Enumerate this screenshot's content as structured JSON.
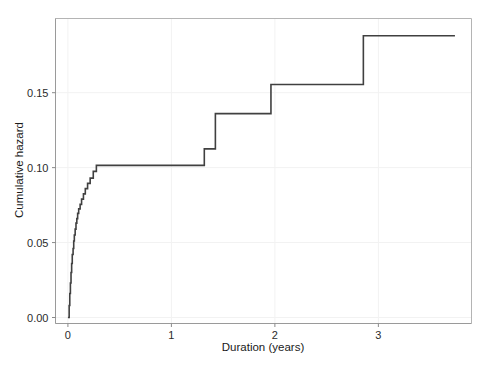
{
  "chart_data": {
    "type": "line",
    "subtype": "step-post",
    "title": "",
    "xlabel": "Duration (years)",
    "ylabel": "Cumulative hazard",
    "xlim": [
      -0.12,
      3.9
    ],
    "ylim": [
      -0.004,
      0.1995
    ],
    "grid": true,
    "grid_color": "#f2f2f2",
    "line_color": "#404040",
    "line_width": 1.6,
    "legend": null,
    "xticks": [
      0,
      1,
      2,
      3
    ],
    "xtick_labels": [
      "0",
      "1",
      "2",
      "3"
    ],
    "yticks": [
      0.0,
      0.05,
      0.1,
      0.15
    ],
    "ytick_labels": [
      "0.00",
      "0.05",
      "0.10",
      "0.15"
    ],
    "x": [
      0.0,
      0.012,
      0.018,
      0.024,
      0.03,
      0.036,
      0.042,
      0.05,
      0.056,
      0.062,
      0.07,
      0.078,
      0.086,
      0.094,
      0.104,
      0.118,
      0.132,
      0.15,
      0.168,
      0.19,
      0.215,
      0.245,
      0.275,
      1.318,
      1.425,
      1.962,
      2.855,
      3.74
    ],
    "y": [
      0.0,
      0.008,
      0.016,
      0.023,
      0.03,
      0.036,
      0.042,
      0.046,
      0.051,
      0.055,
      0.059,
      0.063,
      0.066,
      0.0695,
      0.0725,
      0.0755,
      0.079,
      0.0825,
      0.086,
      0.0895,
      0.093,
      0.0975,
      0.1015,
      0.1125,
      0.136,
      0.1555,
      0.188,
      0.188
    ]
  },
  "axes": {
    "y_label": "Cumulative hazard",
    "x_label": "Duration (years)",
    "x_tick_labels": [
      "0",
      "1",
      "2",
      "3"
    ],
    "y_tick_labels": [
      "0.00",
      "0.05",
      "0.10",
      "0.15"
    ]
  }
}
